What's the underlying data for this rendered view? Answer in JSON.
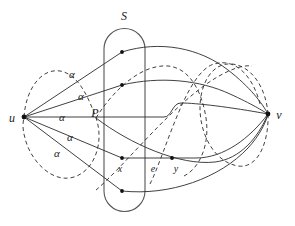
{
  "figure": {
    "type": "graph-diagram",
    "width": 295,
    "height": 226,
    "background_color": "#ffffff",
    "stroke_color": "#2b2b2b",
    "tube_color": "#555555",
    "node_color": "#111111"
  },
  "labels": {
    "set_s": "S",
    "path_p": "P",
    "vertex_u": "u",
    "vertex_v": "v",
    "vertex_x": "x",
    "vertex_y": "y",
    "edge_e": "e",
    "alpha": "α"
  },
  "alpha_labels": [
    {
      "text": "α",
      "x": 72,
      "y": 78
    },
    {
      "text": "α",
      "x": 81,
      "y": 100
    },
    {
      "text": "α",
      "x": 62,
      "y": 121
    },
    {
      "text": "α",
      "x": 70,
      "y": 141
    },
    {
      "text": "α",
      "x": 57,
      "y": 157
    }
  ],
  "vertices": [
    {
      "name": "u",
      "x": 24,
      "y": 117,
      "label_x": 12,
      "label_y": 122
    },
    {
      "name": "v",
      "x": 268,
      "y": 114,
      "label_x": 278,
      "label_y": 119
    },
    {
      "name": "x",
      "x": 122,
      "y": 158,
      "label_x": 118,
      "label_y": 171
    },
    {
      "name": "y",
      "x": 172,
      "y": 158,
      "label_x": 176,
      "label_y": 171
    }
  ],
  "interior_nodes": [
    {
      "x": 122,
      "y": 52
    },
    {
      "x": 122,
      "y": 85
    },
    {
      "x": 122,
      "y": 117
    },
    {
      "x": 122,
      "y": 158
    },
    {
      "x": 172,
      "y": 158
    },
    {
      "x": 122,
      "y": 191
    },
    {
      "x": 205,
      "y": 88
    }
  ],
  "set_label": {
    "text": "S",
    "x": 124,
    "y": 20
  },
  "path_label": {
    "text": "P",
    "x": 95,
    "y": 117
  },
  "edge_label": {
    "text": "e",
    "x": 152,
    "y": 171
  },
  "tube": {
    "left": 104,
    "right": 145,
    "top": 28,
    "bottom": 212,
    "corner_radius": 21
  }
}
